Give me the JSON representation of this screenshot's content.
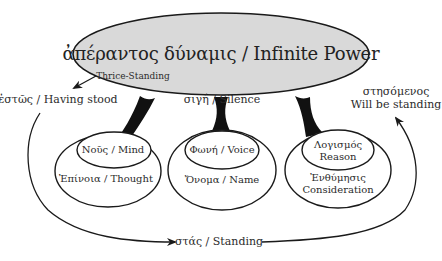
{
  "diagram": {
    "root": {
      "label": "ἀπέραντος δύναμις / Infinite Power",
      "fill": "#d9d9d9",
      "sublabel": "Thrice-Standing",
      "bottom_label": "σιγή / Silence"
    },
    "states": {
      "past": "ἑστῶς / Having stood",
      "present": "στάς / Standing",
      "future_line1": "στησόμενος",
      "future_line2": "Will be standing"
    },
    "pairs": [
      {
        "inner": "Νοῦς / Mind",
        "outer": "Ἐπίνοια / Thought"
      },
      {
        "inner": "Φωνή / Voice",
        "outer": "Ὄνομα / Name"
      },
      {
        "inner_line1": "Λογισμός",
        "inner_line2": "Reason",
        "outer_line1": "Ἐνθύμησις",
        "outer_line2": "Consideration"
      }
    ],
    "colors": {
      "stroke": "#1a1a1a",
      "text": "#2b2b2b",
      "root_fill": "#d9d9d9",
      "background": "#ffffff"
    }
  }
}
